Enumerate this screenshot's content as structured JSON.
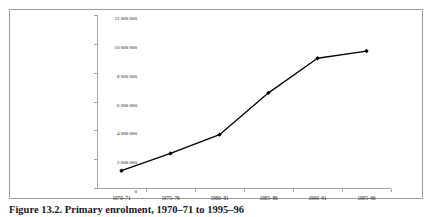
{
  "figure": {
    "caption": "Figure 13.2. Primary enrolment, 1970–71 to 1995–96",
    "frame_color": "#9a9a9a",
    "background": "#ffffff"
  },
  "chart_data": {
    "type": "line",
    "title": "",
    "xlabel": "",
    "ylabel": "",
    "categories": [
      "1970–71",
      "1975–76",
      "1980–81",
      "1985–86",
      "1990–91",
      "1995–96"
    ],
    "values": [
      1200000,
      2400000,
      3700000,
      6600000,
      9000000,
      9500000
    ],
    "series": [
      {
        "name": "Enrolment",
        "values": [
          1200000,
          2400000,
          3700000,
          6600000,
          9000000,
          9500000
        ],
        "line_color": "#000000",
        "marker": "diamond",
        "marker_color": "#000000"
      }
    ],
    "ylim": [
      0,
      12000000
    ],
    "ytick_values": [
      0,
      2000000,
      4000000,
      6000000,
      8000000,
      10000000,
      12000000
    ],
    "ytick_labels": [
      "0",
      "2 000 000",
      "4 000 000",
      "6 000 000",
      "8 000 000",
      "10 000 000",
      "12 000 000"
    ],
    "grid": false,
    "legend": "none",
    "axis_color": "#a6a6a6"
  }
}
